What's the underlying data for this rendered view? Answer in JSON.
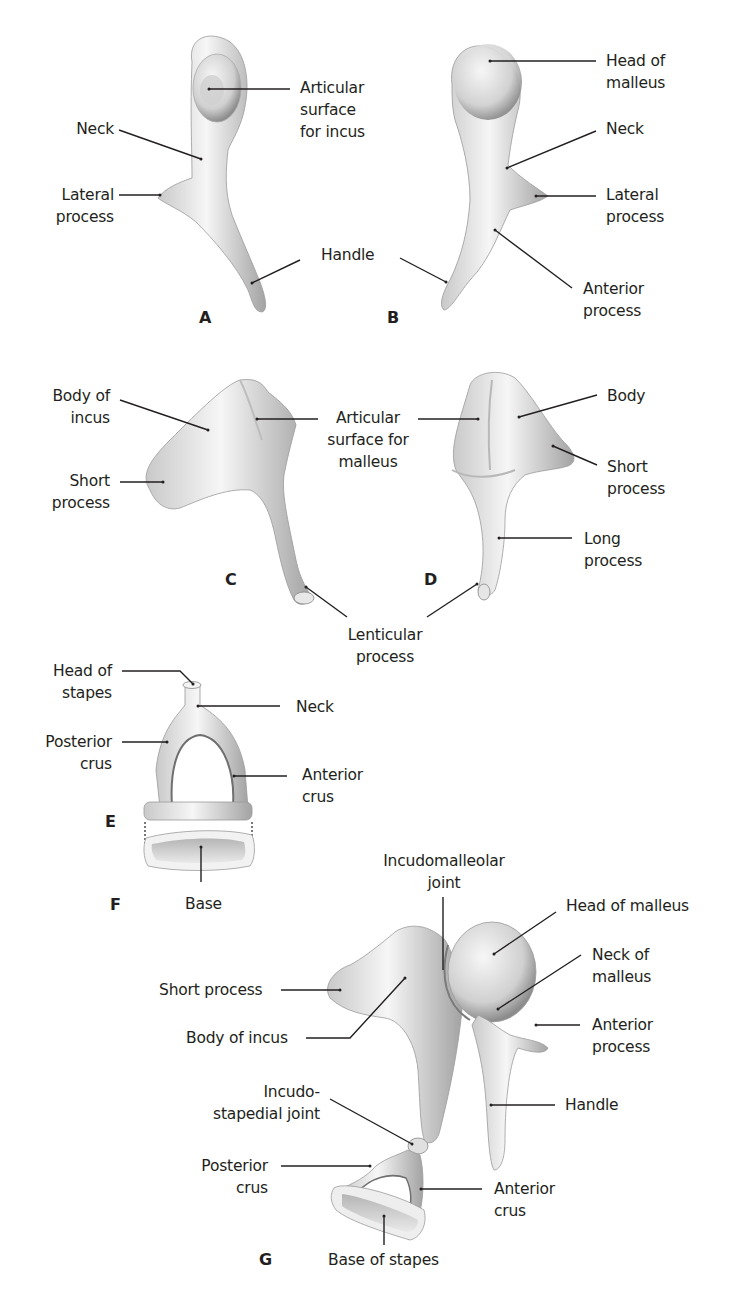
{
  "figure": {
    "panels": [
      {
        "id": "A",
        "caption": "A",
        "subject": "Malleus",
        "labels": [
          "Articular\nsurface\nfor incus",
          "Neck",
          "Lateral\nprocess",
          "Handle"
        ]
      },
      {
        "id": "B",
        "caption": "B",
        "subject": "Malleus",
        "labels": [
          "Head of\nmalleus",
          "Neck",
          "Lateral\nprocess",
          "Anterior\nprocess"
        ]
      },
      {
        "id": "C",
        "caption": "C",
        "subject": "Incus",
        "labels": [
          "Body of\nincus",
          "Short\nprocess",
          "Articular\nsurface for\nmalleus",
          "Lenticular\nprocess"
        ]
      },
      {
        "id": "D",
        "caption": "D",
        "subject": "Incus",
        "labels": [
          "Body",
          "Short\nprocess",
          "Long\nprocess"
        ]
      },
      {
        "id": "E",
        "caption": "E",
        "subject": "Stapes",
        "labels": [
          "Head of\nstapes",
          "Neck",
          "Posterior\ncrus",
          "Anterior\ncrus"
        ]
      },
      {
        "id": "F",
        "caption": "F",
        "subject": "Stapes base",
        "labels": [
          "Base"
        ]
      },
      {
        "id": "G",
        "caption": "G",
        "subject": "Ossicular chain",
        "labels": [
          "Incudomalleolar\njoint",
          "Head of malleus",
          "Neck of\nmalleus",
          "Short process",
          "Body of incus",
          "Anterior\nprocess",
          "Incudo-\nstapedial joint",
          "Handle",
          "Posterior\ncrus",
          "Anterior\ncrus",
          "Base of stapes"
        ]
      }
    ]
  },
  "labels": {
    "a_articular": "Articular\nsurface\nfor incus",
    "a_neck": "Neck",
    "a_lateral": "Lateral\nprocess",
    "ab_handle": "Handle",
    "b_head": "Head of\nmalleus",
    "b_neck": "Neck",
    "b_lateral": "Lateral\nprocess",
    "b_anterior": "Anterior\nprocess",
    "c_body": "Body of\nincus",
    "c_short": "Short\nprocess",
    "cd_articular": "Articular\nsurface for\nmalleus",
    "d_body": "Body",
    "d_short": "Short\nprocess",
    "d_long": "Long\nprocess",
    "cd_lenticular": "Lenticular\nprocess",
    "e_head": "Head of\nstapes",
    "e_neck": "Neck",
    "e_posterior": "Posterior\ncrus",
    "e_anterior": "Anterior\ncrus",
    "f_base": "Base",
    "g_incudomalleolar": "Incudomalleolar\njoint",
    "g_head": "Head of malleus",
    "g_neck": "Neck of\nmalleus",
    "g_short": "Short process",
    "g_body": "Body of incus",
    "g_anterior_process": "Anterior\nprocess",
    "g_incudostapedial": "Incudo-\nstapedial joint",
    "g_handle": "Handle",
    "g_posterior": "Posterior\ncrus",
    "g_anterior_crus": "Anterior\ncrus",
    "g_base": "Base of stapes"
  },
  "captions": {
    "A": "A",
    "B": "B",
    "C": "C",
    "D": "D",
    "E": "E",
    "F": "F",
    "G": "G"
  },
  "colors": {
    "bone_light": "#f4f4f4",
    "bone_mid": "#d6d6d6",
    "bone_dark": "#9a9a9a",
    "text": "#231f20",
    "background": "#ffffff"
  }
}
